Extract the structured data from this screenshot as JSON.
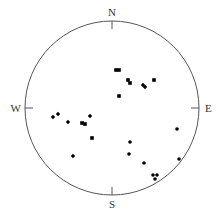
{
  "chart_data": {
    "type": "scatter",
    "subtype": "stereonet",
    "title": "",
    "directions": {
      "north": "N",
      "east": "E",
      "south": "S",
      "west": "W"
    },
    "net": {
      "cx": 112,
      "cy": 108,
      "r": 87,
      "stroke": "#555555"
    },
    "marker_color": "#000000",
    "points": [
      {
        "x": 116,
        "y": 70,
        "shape": "square"
      },
      {
        "x": 119,
        "y": 70,
        "shape": "square"
      },
      {
        "x": 128,
        "y": 80,
        "shape": "square"
      },
      {
        "x": 130,
        "y": 83,
        "shape": "square"
      },
      {
        "x": 143,
        "y": 85,
        "shape": "diamond"
      },
      {
        "x": 145,
        "y": 87,
        "shape": "diamond"
      },
      {
        "x": 154,
        "y": 80,
        "shape": "square"
      },
      {
        "x": 119,
        "y": 96,
        "shape": "square"
      },
      {
        "x": 53,
        "y": 117,
        "shape": "diamond"
      },
      {
        "x": 58,
        "y": 114,
        "shape": "diamond"
      },
      {
        "x": 68,
        "y": 122,
        "shape": "diamond"
      },
      {
        "x": 82,
        "y": 123,
        "shape": "square"
      },
      {
        "x": 85,
        "y": 124,
        "shape": "square"
      },
      {
        "x": 90,
        "y": 116,
        "shape": "diamond"
      },
      {
        "x": 92,
        "y": 138,
        "shape": "square"
      },
      {
        "x": 73,
        "y": 156,
        "shape": "diamond"
      },
      {
        "x": 177,
        "y": 129,
        "shape": "circle"
      },
      {
        "x": 130,
        "y": 142,
        "shape": "circle"
      },
      {
        "x": 129,
        "y": 154,
        "shape": "circle"
      },
      {
        "x": 144,
        "y": 163,
        "shape": "circle"
      },
      {
        "x": 179,
        "y": 159,
        "shape": "circle"
      },
      {
        "x": 153,
        "y": 175,
        "shape": "circle"
      },
      {
        "x": 157,
        "y": 175,
        "shape": "circle"
      },
      {
        "x": 155,
        "y": 179,
        "shape": "circle"
      }
    ]
  }
}
